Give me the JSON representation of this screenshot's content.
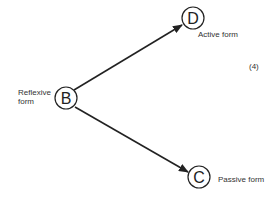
{
  "diagram": {
    "equation_number": "(4)",
    "nodes": [
      {
        "id": "B",
        "letter": "B",
        "label_line1": "Reflexive",
        "label_line2": "form"
      },
      {
        "id": "D",
        "letter": "D",
        "label": "Active form"
      },
      {
        "id": "C",
        "letter": "C",
        "label": "Passive form"
      }
    ],
    "edges": [
      {
        "from": "B",
        "to": "D"
      },
      {
        "from": "B",
        "to": "C"
      }
    ],
    "colors": {
      "stroke": "#222222",
      "text": "#333333",
      "background": "#ffffff"
    }
  }
}
